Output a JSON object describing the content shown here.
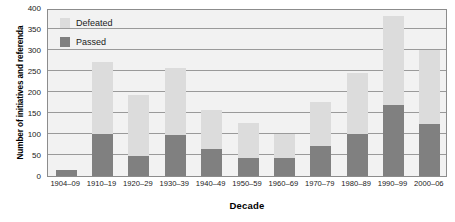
{
  "chart_data": {
    "type": "bar",
    "subtype": "stacked-vertical",
    "title": "",
    "xlabel": "Decade",
    "ylabel": "Number of initiatives and referenda",
    "categories": [
      "1904–09",
      "1910–19",
      "1920–29",
      "1930–39",
      "1940–49",
      "1950–59",
      "1960–69",
      "1970–79",
      "1980–89",
      "1990–99",
      "2000–06"
    ],
    "series": [
      {
        "name": "Passed",
        "color": "#808080",
        "values": [
          15,
          101,
          48,
          97,
          64,
          42,
          42,
          72,
          101,
          168,
          123
        ]
      },
      {
        "name": "Defeated",
        "color": "#dcdcdc",
        "values": [
          0,
          171,
          144,
          161,
          94,
          85,
          57,
          104,
          144,
          212,
          178
        ]
      }
    ],
    "totals": [
      15,
      272,
      192,
      258,
      158,
      127,
      99,
      176,
      245,
      380,
      301
    ],
    "ylim": [
      0,
      400
    ],
    "yticks": [
      0,
      50,
      100,
      150,
      200,
      250,
      300,
      350,
      400
    ],
    "ytick_labels": [
      "0",
      "50",
      "100",
      "150",
      "200",
      "250",
      "300",
      "350",
      "400"
    ],
    "grid": "horizontal",
    "legend_position": "top-left-inside",
    "legend_entries": [
      {
        "label": "Defeated",
        "color": "#dcdcdc"
      },
      {
        "label": "Passed",
        "color": "#808080"
      }
    ],
    "plot_background": "#f2f2f2",
    "axis_color": "#8c8c8c",
    "gridline_color": "#9a9a9a"
  }
}
